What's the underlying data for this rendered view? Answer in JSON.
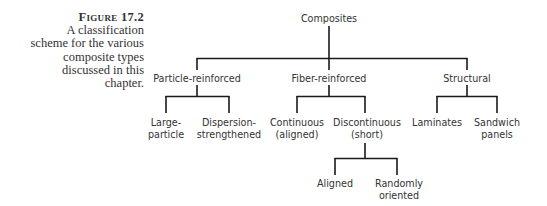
{
  "caption": {
    "figure_label": "Figure 17.2",
    "lines": [
      "A classification",
      "scheme for the various",
      "composite types",
      "discussed in this",
      "chapter."
    ]
  },
  "tree": {
    "root": "Composites",
    "level1": {
      "particle": "Particle-reinforced",
      "fiber": "Fiber-reinforced",
      "structural": "Structural"
    },
    "level2": {
      "large_particle": [
        "Large-",
        "particle"
      ],
      "dispersion": [
        "Dispersion-",
        "strengthened"
      ],
      "continuous": [
        "Continuous",
        "(aligned)"
      ],
      "discontinuous": [
        "Discontinuous",
        "(short)"
      ],
      "laminates": [
        "Laminates"
      ],
      "sandwich": [
        "Sandwich",
        "panels"
      ]
    },
    "level3": {
      "aligned": [
        "Aligned"
      ],
      "random": [
        "Randomly",
        "oriented"
      ]
    }
  }
}
